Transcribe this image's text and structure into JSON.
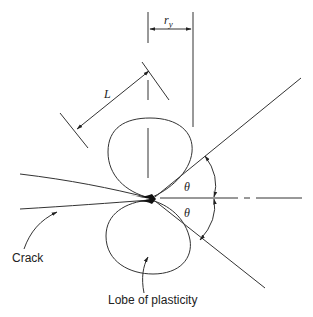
{
  "diagram": {
    "type": "crack-tip plasticity schematic",
    "labels": {
      "ry": "r",
      "ry_sub": "y",
      "L": "L",
      "theta_upper": "θ",
      "theta_lower": "θ",
      "crack": "Crack",
      "lobe": "Lobe of plasticity"
    },
    "colors": {
      "line": "#333333",
      "text": "#222222",
      "background": "#ffffff"
    }
  }
}
